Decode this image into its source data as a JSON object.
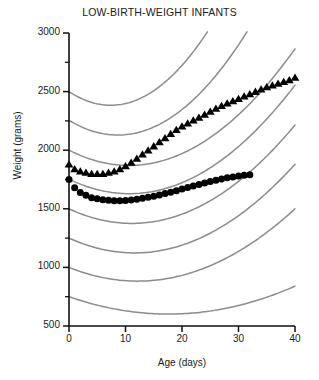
{
  "chart_data": {
    "type": "scatter",
    "title": "LOW-BIRTH-WEIGHT INFANTS",
    "xlabel": "Age (days)",
    "ylabel": "Weight (grams)",
    "xlim": [
      0,
      40
    ],
    "ylim": [
      500,
      3000
    ],
    "grid": false,
    "legend": "none",
    "x_major_ticks": [
      0,
      10,
      20,
      30,
      40
    ],
    "x_tick_labels": [
      "0",
      "10",
      "20",
      "30",
      "40"
    ],
    "y_major_ticks": [
      500,
      1000,
      1500,
      2000,
      2500,
      3000
    ],
    "y_tick_labels": [
      "500",
      "1000",
      "1500",
      "2000",
      "2500",
      "3000"
    ],
    "y_minor_ticks": [
      750,
      1250,
      1750,
      2250,
      2750
    ],
    "reference_curve_color": "#8c8c8c",
    "marker_color": "#000000",
    "series": [
      {
        "name": "triangle-series",
        "marker": "triangle",
        "x": [
          0,
          1,
          2,
          3,
          4,
          5,
          6,
          7,
          8,
          9,
          10,
          11,
          12,
          13,
          14,
          15,
          16,
          17,
          18,
          19,
          20,
          21,
          22,
          23,
          24,
          25,
          26,
          27,
          28,
          29,
          30,
          31,
          32,
          33,
          34,
          35,
          36,
          37,
          38,
          39,
          40
        ],
        "y": [
          1880,
          1840,
          1820,
          1810,
          1800,
          1800,
          1800,
          1810,
          1820,
          1840,
          1865,
          1895,
          1930,
          1965,
          2000,
          2035,
          2070,
          2105,
          2140,
          2175,
          2205,
          2230,
          2255,
          2280,
          2305,
          2330,
          2355,
          2380,
          2400,
          2420,
          2440,
          2460,
          2480,
          2500,
          2520,
          2540,
          2555,
          2570,
          2585,
          2600,
          2620
        ]
      },
      {
        "name": "circle-series",
        "marker": "circle",
        "x": [
          0,
          1,
          2,
          3,
          4,
          5,
          6,
          7,
          8,
          9,
          10,
          11,
          12,
          13,
          14,
          15,
          16,
          17,
          18,
          19,
          20,
          21,
          22,
          23,
          24,
          25,
          26,
          27,
          28,
          29,
          30,
          31,
          32
        ],
        "y": [
          1750,
          1680,
          1640,
          1615,
          1595,
          1585,
          1578,
          1572,
          1568,
          1568,
          1570,
          1575,
          1582,
          1590,
          1598,
          1608,
          1618,
          1630,
          1642,
          1655,
          1668,
          1682,
          1695,
          1708,
          1720,
          1732,
          1744,
          1754,
          1764,
          1772,
          1780,
          1786,
          1790
        ]
      }
    ],
    "reference_curves": [
      {
        "name": "percentile-curve-1",
        "start_y": 2500,
        "min_y": 2385,
        "min_x": 6.5,
        "end_x": 24.5,
        "end_y": 3010
      },
      {
        "name": "percentile-curve-2",
        "start_y": 2255,
        "min_y": 2135,
        "min_x": 6.8,
        "end_x": 31.5,
        "end_y": 3010
      },
      {
        "name": "percentile-curve-3",
        "start_y": 2000,
        "min_y": 1885,
        "min_x": 7.0,
        "end_x": 40,
        "end_y": 2865
      },
      {
        "name": "percentile-curve-4",
        "start_y": 1752,
        "min_y": 1640,
        "min_x": 7.5,
        "end_x": 40,
        "end_y": 2555
      },
      {
        "name": "percentile-curve-5",
        "start_y": 1500,
        "min_y": 1385,
        "min_x": 8.0,
        "end_x": 40,
        "end_y": 2215
      },
      {
        "name": "percentile-curve-6",
        "start_y": 1250,
        "min_y": 1130,
        "min_x": 9.0,
        "end_x": 40,
        "end_y": 1880
      },
      {
        "name": "percentile-curve-7",
        "start_y": 1000,
        "min_y": 885,
        "min_x": 10.5,
        "end_x": 40,
        "end_y": 1500
      },
      {
        "name": "percentile-curve-8",
        "start_y": 750,
        "min_y": 610,
        "min_x": 13.5,
        "end_x": 40,
        "end_y": 840
      }
    ]
  }
}
